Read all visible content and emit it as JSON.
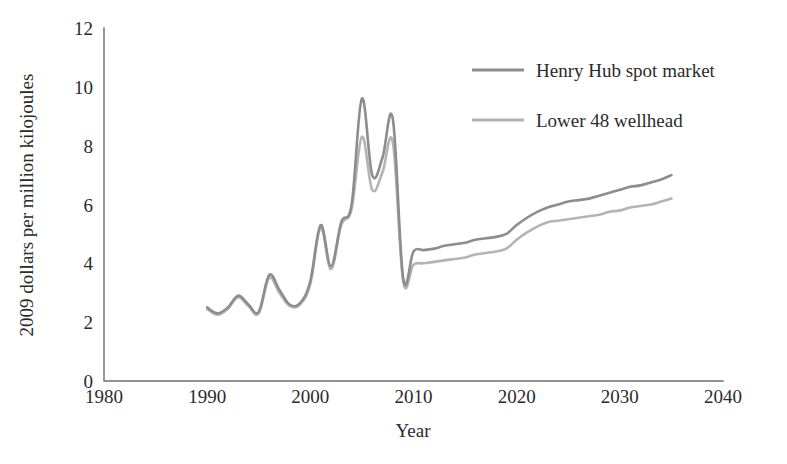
{
  "chart_data": {
    "type": "line",
    "title": "",
    "xlabel": "Year",
    "ylabel": "2009 dollars per million kilojoules",
    "xlim": [
      1980,
      2040
    ],
    "ylim": [
      0,
      12
    ],
    "xticks": [
      1980,
      1990,
      2000,
      2010,
      2020,
      2030,
      2040
    ],
    "xtick_labels": [
      "1980",
      "1990",
      "2000",
      "2010",
      "2020",
      "2030",
      "2040"
    ],
    "yticks": [
      0,
      2,
      4,
      6,
      8,
      10,
      12
    ],
    "ytick_labels": [
      "0",
      "2",
      "4",
      "6",
      "8",
      "10",
      "12"
    ],
    "grid": false,
    "legend_position": "upper right",
    "series": [
      {
        "name": "Henry Hub spot market",
        "color": "#8d8d8d",
        "x": [
          1990,
          1991,
          1992,
          1993,
          1994,
          1995,
          1996,
          1997,
          1998,
          1999,
          2000,
          2001,
          2002,
          2003,
          2004,
          2005,
          2006,
          2007,
          2008,
          2009,
          2010,
          2011,
          2012,
          2013,
          2014,
          2015,
          2016,
          2017,
          2018,
          2019,
          2020,
          2021,
          2022,
          2023,
          2024,
          2025,
          2026,
          2027,
          2028,
          2029,
          2030,
          2031,
          2032,
          2033,
          2034,
          2035
        ],
        "y": [
          2.5,
          2.3,
          2.5,
          2.9,
          2.6,
          2.35,
          3.6,
          3.1,
          2.6,
          2.65,
          3.4,
          5.3,
          3.9,
          5.4,
          6.0,
          9.6,
          7.0,
          7.6,
          8.9,
          3.5,
          4.4,
          4.45,
          4.5,
          4.6,
          4.65,
          4.7,
          4.8,
          4.85,
          4.9,
          5.0,
          5.3,
          5.55,
          5.75,
          5.9,
          6.0,
          6.1,
          6.15,
          6.2,
          6.3,
          6.4,
          6.5,
          6.6,
          6.65,
          6.75,
          6.85,
          7.0
        ]
      },
      {
        "name": "Lower 48 wellhead",
        "color": "#b4b4b4",
        "x": [
          1990,
          1991,
          1992,
          1993,
          1994,
          1995,
          1996,
          1997,
          1998,
          1999,
          2000,
          2001,
          2002,
          2003,
          2004,
          2005,
          2006,
          2007,
          2008,
          2009,
          2010,
          2011,
          2012,
          2013,
          2014,
          2015,
          2016,
          2017,
          2018,
          2019,
          2020,
          2021,
          2022,
          2023,
          2024,
          2025,
          2026,
          2027,
          2028,
          2029,
          2030,
          2031,
          2032,
          2033,
          2034,
          2035
        ],
        "y": [
          2.45,
          2.25,
          2.45,
          2.85,
          2.55,
          2.3,
          3.5,
          3.0,
          2.55,
          2.6,
          3.3,
          5.2,
          3.8,
          5.3,
          5.85,
          8.3,
          6.5,
          7.1,
          8.1,
          3.4,
          3.95,
          4.0,
          4.05,
          4.1,
          4.15,
          4.2,
          4.3,
          4.35,
          4.4,
          4.5,
          4.8,
          5.05,
          5.25,
          5.4,
          5.45,
          5.5,
          5.55,
          5.6,
          5.65,
          5.75,
          5.8,
          5.9,
          5.95,
          6.0,
          6.1,
          6.2
        ]
      }
    ]
  },
  "legend": {
    "items": [
      {
        "label": "Henry Hub spot market",
        "color": "#8d8d8d"
      },
      {
        "label": "Lower 48 wellhead",
        "color": "#b4b4b4"
      }
    ]
  },
  "axes": {
    "x_title": "Year",
    "y_title": "2009 dollars per million kilojoules"
  }
}
